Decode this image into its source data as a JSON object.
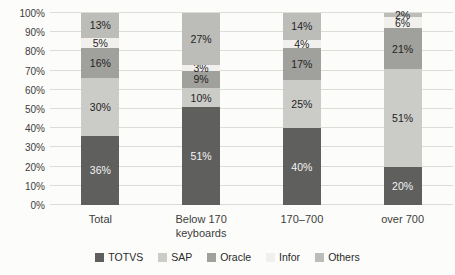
{
  "chart_data": {
    "type": "bar",
    "subtype": "stacked-100-percent",
    "title": "",
    "xlabel": "",
    "ylabel": "",
    "ylim": [
      0,
      100
    ],
    "y_tick_step": 10,
    "y_tick_labels": [
      "0%",
      "10%",
      "20%",
      "30%",
      "40%",
      "50%",
      "60%",
      "70%",
      "80%",
      "90%",
      "100%"
    ],
    "grid": true,
    "legend_position": "bottom",
    "categories": [
      "Total",
      "Below 170\nkeyboards",
      "170–700",
      "over 700"
    ],
    "series": [
      {
        "name": "TOTVS",
        "color": "#5f5f5e",
        "label_color": "#f5f5f3",
        "values": [
          36,
          51,
          40,
          20
        ]
      },
      {
        "name": "SAP",
        "color": "#cbcbc8",
        "label_color": "#1f1f1f",
        "values": [
          30,
          10,
          25,
          51
        ]
      },
      {
        "name": "Oracle",
        "color": "#a0a09d",
        "label_color": "#1f1f1f",
        "values": [
          16,
          9,
          17,
          21
        ]
      },
      {
        "name": "Infor",
        "color": "#f1f0ec",
        "label_color": "#1f1f1f",
        "values": [
          5,
          3,
          4,
          6
        ]
      },
      {
        "name": "Others",
        "color": "#bcbcb9",
        "label_color": "#1f1f1f",
        "values": [
          13,
          27,
          14,
          2
        ]
      }
    ],
    "data_label_suffix": "%"
  }
}
